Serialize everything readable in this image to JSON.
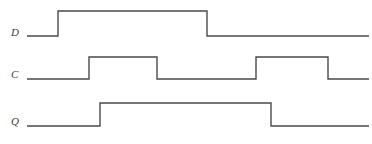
{
  "diagram": {
    "kind": "digital-timing-diagram",
    "title": "",
    "background_color": "#ffffff",
    "trace_color": "#4a4a4a",
    "trace_width": 1.4,
    "width": 372,
    "height": 144,
    "x_start": 27,
    "x_end": 369,
    "signals": [
      {
        "name": "D",
        "label": "D",
        "label_x": 11,
        "label_y": 27,
        "high_y": 11,
        "low_y": 36,
        "initial_level": 0,
        "transitions": [
          {
            "x": 58,
            "to": 1,
            "edge": "rising"
          },
          {
            "x": 207,
            "to": 0,
            "edge": "falling"
          }
        ]
      },
      {
        "name": "C",
        "label": "C",
        "label_x": 11,
        "label_y": 69,
        "high_y": 57,
        "low_y": 79,
        "initial_level": 0,
        "transitions": [
          {
            "x": 89,
            "to": 1,
            "edge": "rising"
          },
          {
            "x": 157,
            "to": 0,
            "edge": "falling"
          },
          {
            "x": 256,
            "to": 1,
            "edge": "rising"
          },
          {
            "x": 328,
            "to": 0,
            "edge": "falling"
          }
        ]
      },
      {
        "name": "Q",
        "label": "Q",
        "label_x": 11,
        "label_y": 116,
        "high_y": 103,
        "low_y": 126,
        "initial_level": 0,
        "transitions": [
          {
            "x": 100,
            "to": 1,
            "edge": "rising"
          },
          {
            "x": 271,
            "to": 0,
            "edge": "falling"
          }
        ]
      }
    ],
    "chart_data": {
      "type": "line",
      "title": "",
      "xlabel": "",
      "ylabel": "",
      "series": [
        {
          "name": "D",
          "x": [
            27,
            58,
            58,
            207,
            207,
            369
          ],
          "values": [
            0,
            0,
            1,
            1,
            0,
            0
          ]
        },
        {
          "name": "C",
          "x": [
            27,
            89,
            89,
            157,
            157,
            256,
            256,
            328,
            328,
            369
          ],
          "values": [
            0,
            0,
            1,
            1,
            0,
            0,
            1,
            1,
            0,
            0
          ]
        },
        {
          "name": "Q",
          "x": [
            27,
            100,
            100,
            271,
            271,
            369
          ],
          "values": [
            0,
            0,
            1,
            1,
            0,
            0
          ]
        }
      ]
    }
  }
}
